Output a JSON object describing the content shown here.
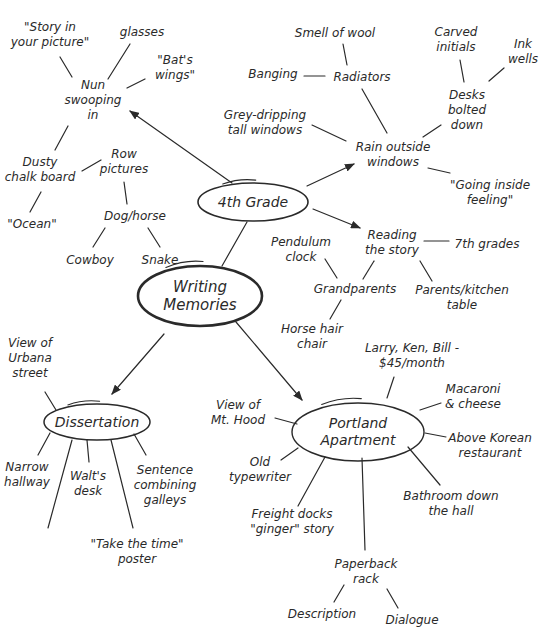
{
  "diagram": {
    "title": "Writing Memories",
    "type": "mind-map",
    "colors": {
      "ink": "#2a2a2a",
      "background": "#ffffff"
    },
    "nodes": [
      {
        "id": "root",
        "text": "Writing\nMemories",
        "x": 200,
        "y": 296,
        "kind": "root"
      },
      {
        "id": "grade4",
        "text": "4th Grade",
        "x": 253,
        "y": 202,
        "kind": "hub"
      },
      {
        "id": "diss",
        "text": "Dissertation",
        "x": 97,
        "y": 422,
        "kind": "hub"
      },
      {
        "id": "portland",
        "text": "Portland\nApartment",
        "x": 358,
        "y": 432,
        "kind": "hub"
      },
      {
        "id": "nun",
        "text": "Nun\nswooping\nin",
        "x": 93,
        "y": 100,
        "kind": "leaf"
      },
      {
        "id": "story_pic",
        "text": "\"Story in\nyour picture\"",
        "x": 50,
        "y": 35,
        "kind": "leaf"
      },
      {
        "id": "glasses",
        "text": "glasses",
        "x": 142,
        "y": 32,
        "kind": "leaf"
      },
      {
        "id": "bats",
        "text": "\"Bat's\nwings\"",
        "x": 175,
        "y": 68,
        "kind": "leaf"
      },
      {
        "id": "chalk",
        "text": "Dusty\nchalk board",
        "x": 40,
        "y": 170,
        "kind": "leaf"
      },
      {
        "id": "ocean",
        "text": "\"Ocean\"",
        "x": 32,
        "y": 224,
        "kind": "leaf"
      },
      {
        "id": "row",
        "text": "Row\npictures",
        "x": 124,
        "y": 162,
        "kind": "leaf"
      },
      {
        "id": "dog",
        "text": "Dog/horse",
        "x": 135,
        "y": 216,
        "kind": "leaf"
      },
      {
        "id": "cowboy",
        "text": "Cowboy",
        "x": 90,
        "y": 260,
        "kind": "leaf"
      },
      {
        "id": "snake",
        "text": "Snake",
        "x": 160,
        "y": 260,
        "kind": "leaf"
      },
      {
        "id": "smell",
        "text": "Smell of wool",
        "x": 335,
        "y": 33,
        "kind": "leaf"
      },
      {
        "id": "radiators",
        "text": "Radiators",
        "x": 362,
        "y": 77,
        "kind": "leaf"
      },
      {
        "id": "banging",
        "text": "Banging",
        "x": 273,
        "y": 74,
        "kind": "leaf"
      },
      {
        "id": "carved",
        "text": "Carved\ninitials",
        "x": 456,
        "y": 40,
        "kind": "leaf"
      },
      {
        "id": "ink",
        "text": "Ink\nwells",
        "x": 523,
        "y": 52,
        "kind": "leaf"
      },
      {
        "id": "desks",
        "text": "Desks\nbolted\ndown",
        "x": 467,
        "y": 110,
        "kind": "leaf"
      },
      {
        "id": "grey",
        "text": "Grey-dripping\ntall windows",
        "x": 265,
        "y": 123,
        "kind": "leaf"
      },
      {
        "id": "rain",
        "text": "Rain outside\nwindows",
        "x": 393,
        "y": 155,
        "kind": "leaf"
      },
      {
        "id": "going",
        "text": "\"Going inside\nfeeling\"",
        "x": 490,
        "y": 193,
        "kind": "leaf"
      },
      {
        "id": "reading",
        "text": "Reading\nthe story",
        "x": 392,
        "y": 243,
        "kind": "leaf"
      },
      {
        "id": "seventh",
        "text": "7th grades",
        "x": 487,
        "y": 244,
        "kind": "leaf"
      },
      {
        "id": "pendulum",
        "text": "Pendulum\nclock",
        "x": 301,
        "y": 250,
        "kind": "leaf"
      },
      {
        "id": "grandparents",
        "text": "Grandparents",
        "x": 355,
        "y": 289,
        "kind": "leaf"
      },
      {
        "id": "parents",
        "text": "Parents/kitchen\ntable",
        "x": 462,
        "y": 298,
        "kind": "leaf"
      },
      {
        "id": "horsehair",
        "text": "Horse hair\nchair",
        "x": 312,
        "y": 337,
        "kind": "leaf"
      },
      {
        "id": "urbana",
        "text": "View of\nUrbana\nstreet",
        "x": 30,
        "y": 358,
        "kind": "leaf"
      },
      {
        "id": "narrow",
        "text": "Narrow\nhallway",
        "x": 27,
        "y": 475,
        "kind": "leaf"
      },
      {
        "id": "walts",
        "text": "Walt's\ndesk",
        "x": 88,
        "y": 484,
        "kind": "leaf"
      },
      {
        "id": "sentence",
        "text": "Sentence\ncombining\ngalleys",
        "x": 165,
        "y": 485,
        "kind": "leaf"
      },
      {
        "id": "takethetime",
        "text": "\"Take the time\"\nposter",
        "x": 137,
        "y": 552,
        "kind": "leaf"
      },
      {
        "id": "larry",
        "text": "Larry, Ken, Bill -\n$45/month",
        "x": 412,
        "y": 356,
        "kind": "leaf"
      },
      {
        "id": "mtHood",
        "text": "View of\nMt. Hood",
        "x": 238,
        "y": 413,
        "kind": "leaf"
      },
      {
        "id": "macaroni",
        "text": "Macaroni\n& cheese",
        "x": 473,
        "y": 397,
        "kind": "leaf"
      },
      {
        "id": "korean",
        "text": "Above Korean\nrestaurant",
        "x": 490,
        "y": 446,
        "kind": "leaf"
      },
      {
        "id": "typewriter",
        "text": "Old\ntypewriter",
        "x": 260,
        "y": 470,
        "kind": "leaf"
      },
      {
        "id": "bathroom",
        "text": "Bathroom down\nthe hall",
        "x": 451,
        "y": 504,
        "kind": "leaf"
      },
      {
        "id": "freight",
        "text": "Freight docks\n\"ginger\" story",
        "x": 292,
        "y": 522,
        "kind": "leaf"
      },
      {
        "id": "paperback",
        "text": "Paperback\nrack",
        "x": 366,
        "y": 572,
        "kind": "leaf"
      },
      {
        "id": "description",
        "text": "Description",
        "x": 322,
        "y": 614,
        "kind": "leaf"
      },
      {
        "id": "dialogue",
        "text": "Dialogue",
        "x": 412,
        "y": 620,
        "kind": "leaf"
      }
    ],
    "edges": [
      {
        "from": "root",
        "to": "grade4",
        "x1": 222,
        "y1": 266,
        "x2": 247,
        "y2": 222,
        "arrow": false
      },
      {
        "from": "root",
        "to": "diss",
        "x1": 164,
        "y1": 334,
        "x2": 112,
        "y2": 394,
        "arrow": true
      },
      {
        "from": "root",
        "to": "portland",
        "x1": 236,
        "y1": 322,
        "x2": 302,
        "y2": 400,
        "arrow": true
      },
      {
        "from": "grade4",
        "to": "nun",
        "x1": 232,
        "y1": 183,
        "x2": 130,
        "y2": 111,
        "arrow": true
      },
      {
        "from": "grade4",
        "to": "rain",
        "x1": 307,
        "y1": 186,
        "x2": 354,
        "y2": 164,
        "arrow": true
      },
      {
        "from": "grade4",
        "to": "reading",
        "x1": 313,
        "y1": 209,
        "x2": 360,
        "y2": 228,
        "arrow": true
      },
      {
        "from": "nun",
        "to": "story_pic",
        "x1": 60,
        "y1": 57,
        "x2": 72,
        "y2": 77,
        "arrow": false
      },
      {
        "from": "nun",
        "to": "glasses",
        "x1": 130,
        "y1": 44,
        "x2": 108,
        "y2": 79,
        "arrow": false
      },
      {
        "from": "nun",
        "to": "bats",
        "x1": 145,
        "y1": 79,
        "x2": 127,
        "y2": 88,
        "arrow": false
      },
      {
        "from": "nun",
        "to": "chalk",
        "x1": 68,
        "y1": 126,
        "x2": 55,
        "y2": 150,
        "arrow": false
      },
      {
        "from": "chalk",
        "to": "ocean",
        "x1": 41,
        "y1": 192,
        "x2": 30,
        "y2": 212,
        "arrow": false
      },
      {
        "from": "chalk",
        "to": "row",
        "x1": 82,
        "y1": 171,
        "x2": 101,
        "y2": 160,
        "arrow": false
      },
      {
        "from": "row",
        "to": "dog",
        "x1": 124,
        "y1": 182,
        "x2": 127,
        "y2": 204,
        "arrow": false
      },
      {
        "from": "dog",
        "to": "cowboy",
        "x1": 105,
        "y1": 228,
        "x2": 93,
        "y2": 247,
        "arrow": false
      },
      {
        "from": "dog",
        "to": "snake",
        "x1": 148,
        "y1": 228,
        "x2": 160,
        "y2": 247,
        "arrow": false
      },
      {
        "from": "radiators",
        "to": "smell",
        "x1": 343,
        "y1": 44,
        "x2": 347,
        "y2": 65,
        "arrow": false
      },
      {
        "from": "radiators",
        "to": "banging",
        "x1": 304,
        "y1": 76,
        "x2": 325,
        "y2": 76,
        "arrow": false
      },
      {
        "from": "rain",
        "to": "radiators",
        "x1": 362,
        "y1": 89,
        "x2": 387,
        "y2": 133,
        "arrow": false
      },
      {
        "from": "desks",
        "to": "carved",
        "x1": 460,
        "y1": 60,
        "x2": 464,
        "y2": 82,
        "arrow": false
      },
      {
        "from": "desks",
        "to": "ink",
        "x1": 504,
        "y1": 68,
        "x2": 489,
        "y2": 81,
        "arrow": false
      },
      {
        "from": "rain",
        "to": "desks",
        "x1": 441,
        "y1": 125,
        "x2": 423,
        "y2": 137,
        "arrow": false
      },
      {
        "from": "rain",
        "to": "grey",
        "x1": 312,
        "y1": 125,
        "x2": 346,
        "y2": 141,
        "arrow": false
      },
      {
        "from": "rain",
        "to": "going",
        "x1": 428,
        "y1": 168,
        "x2": 450,
        "y2": 173,
        "arrow": false
      },
      {
        "from": "reading",
        "to": "seventh",
        "x1": 424,
        "y1": 241,
        "x2": 449,
        "y2": 241,
        "arrow": false
      },
      {
        "from": "reading",
        "to": "grandparents",
        "x1": 374,
        "y1": 261,
        "x2": 363,
        "y2": 279,
        "arrow": false
      },
      {
        "from": "reading",
        "to": "parents",
        "x1": 420,
        "y1": 261,
        "x2": 432,
        "y2": 281,
        "arrow": false
      },
      {
        "from": "grandparents",
        "to": "pendulum",
        "x1": 325,
        "y1": 259,
        "x2": 337,
        "y2": 278,
        "arrow": false
      },
      {
        "from": "grandparents",
        "to": "horsehair",
        "x1": 341,
        "y1": 300,
        "x2": 330,
        "y2": 319,
        "arrow": false
      },
      {
        "from": "diss",
        "to": "urbana",
        "x1": 45,
        "y1": 392,
        "x2": 56,
        "y2": 410,
        "arrow": false
      },
      {
        "from": "diss",
        "to": "narrow",
        "x1": 50,
        "y1": 433,
        "x2": 38,
        "y2": 455,
        "arrow": false
      },
      {
        "from": "diss",
        "to": "line_a",
        "x1": 72,
        "y1": 440,
        "x2": 48,
        "y2": 528,
        "arrow": false
      },
      {
        "from": "diss",
        "to": "walts",
        "x1": 87,
        "y1": 440,
        "x2": 89,
        "y2": 462,
        "arrow": false
      },
      {
        "from": "diss",
        "to": "takethetime",
        "x1": 111,
        "y1": 440,
        "x2": 133,
        "y2": 528,
        "arrow": false
      },
      {
        "from": "diss",
        "to": "sentence",
        "x1": 134,
        "y1": 434,
        "x2": 146,
        "y2": 455,
        "arrow": false
      },
      {
        "from": "portland",
        "to": "larry",
        "x1": 394,
        "y1": 377,
        "x2": 387,
        "y2": 398,
        "arrow": false
      },
      {
        "from": "portland",
        "to": "mtHood",
        "x1": 275,
        "y1": 418,
        "x2": 297,
        "y2": 424,
        "arrow": false
      },
      {
        "from": "portland",
        "to": "macaroni",
        "x1": 420,
        "y1": 410,
        "x2": 441,
        "y2": 403,
        "arrow": false
      },
      {
        "from": "portland",
        "to": "korean",
        "x1": 425,
        "y1": 433,
        "x2": 446,
        "y2": 437,
        "arrow": false
      },
      {
        "from": "portland",
        "to": "typewriter",
        "x1": 281,
        "y1": 460,
        "x2": 298,
        "y2": 448,
        "arrow": false
      },
      {
        "from": "portland",
        "to": "bathroom",
        "x1": 408,
        "y1": 447,
        "x2": 440,
        "y2": 485,
        "arrow": false
      },
      {
        "from": "portland",
        "to": "freight",
        "x1": 298,
        "y1": 506,
        "x2": 325,
        "y2": 457,
        "arrow": false
      },
      {
        "from": "portland",
        "to": "paperback",
        "x1": 362,
        "y1": 458,
        "x2": 365,
        "y2": 550,
        "arrow": false
      },
      {
        "from": "paperback",
        "to": "description",
        "x1": 344,
        "y1": 585,
        "x2": 334,
        "y2": 602,
        "arrow": false
      },
      {
        "from": "paperback",
        "to": "dialogue",
        "x1": 387,
        "y1": 589,
        "x2": 398,
        "y2": 608,
        "arrow": false
      }
    ],
    "ellipses": [
      {
        "id": "grade4",
        "cx": 253,
        "cy": 202,
        "rx": 55,
        "ry": 19,
        "stroke": 1.6
      },
      {
        "id": "root",
        "cx": 200,
        "cy": 296,
        "rx": 62,
        "ry": 30,
        "stroke": 2.6
      },
      {
        "id": "diss",
        "cx": 97,
        "cy": 422,
        "rx": 53,
        "ry": 18,
        "stroke": 1.5
      },
      {
        "id": "portland",
        "cx": 358,
        "cy": 432,
        "rx": 66,
        "ry": 29,
        "stroke": 1.4
      }
    ]
  }
}
